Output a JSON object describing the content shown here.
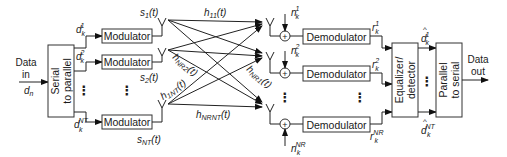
{
  "diagram": {
    "type": "MIMO block diagram",
    "input": {
      "label_line1": "Data",
      "label_line2": "in",
      "symbol": "d",
      "symbol_sub": "n"
    },
    "output": {
      "label_line1": "Data",
      "label_line2": "out"
    },
    "serial_to_parallel": {
      "line1": "Serial",
      "line2": "to parallel"
    },
    "parallel_to_serial": {
      "line1": "Parallel",
      "line2": "to serial"
    },
    "equalizer": {
      "line1": "Equalizer/",
      "line2": "detector"
    },
    "modulator_label": "Modulator",
    "demodulator_label": "Demodulator",
    "tx_streams": [
      {
        "d": "d",
        "d_sub": "k",
        "d_sup": "1",
        "s": "s",
        "s_sub": "1",
        "s_arg": "(t)"
      },
      {
        "d": "d",
        "d_sub": "k",
        "d_sup": "2",
        "s": "s",
        "s_sub": "2",
        "s_arg": "(t)"
      },
      {
        "d": "d",
        "d_sub": "k",
        "d_sup": "NT",
        "s": "s",
        "s_sub": "NT",
        "s_arg": "(t)"
      }
    ],
    "rx_streams": [
      {
        "n": "n",
        "n_sub": "k",
        "n_sup": "1",
        "r": "r",
        "r_sub": "k",
        "r_sup": "1"
      },
      {
        "n": "n",
        "n_sub": "k",
        "n_sup": "2",
        "r": "r",
        "r_sub": "k",
        "r_sup": "2"
      },
      {
        "n": "n",
        "n_sub": "k",
        "n_sup": "NR",
        "r": "r",
        "r_sub": "k",
        "r_sup": "NR"
      }
    ],
    "estimates": [
      {
        "d": "d",
        "hat": "^",
        "d_sub": "k",
        "d_sup": "1"
      },
      {
        "d": "d",
        "hat": "^",
        "d_sub": "k",
        "d_sup": "NT"
      }
    ],
    "channels": [
      {
        "h": "h",
        "sub": "11",
        "arg": "(t)"
      },
      {
        "h": "h",
        "sub": "NR2",
        "arg": "(t)"
      },
      {
        "h": "h",
        "sub": "NR1",
        "arg": "(t)"
      },
      {
        "h": "h",
        "sub": "1NT",
        "arg": "(t)"
      },
      {
        "h": "h",
        "sub": "NRNT",
        "arg": "(t)"
      }
    ],
    "ellipsis": "⋮",
    "adder_symbol": "+"
  }
}
